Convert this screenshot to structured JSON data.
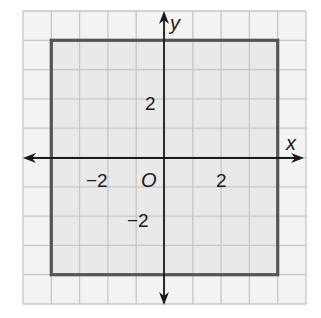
{
  "figure": {
    "type": "coordinate-grid",
    "grid": {
      "x_range": [
        -5,
        5
      ],
      "y_range": [
        -5,
        5
      ],
      "step": 1,
      "background": "#f3f3f3",
      "line_color": "#c6c6c6"
    },
    "axes": {
      "x_label": "x",
      "y_label": "y",
      "origin_label": "O",
      "color": "#1a1a1a"
    },
    "tick_labels": {
      "x": [
        {
          "value": -2,
          "text": "−2"
        },
        {
          "value": 2,
          "text": "2"
        }
      ],
      "y": [
        {
          "value": 2,
          "text": "2"
        },
        {
          "value": -2,
          "text": "−2"
        }
      ]
    },
    "shape": {
      "type": "square",
      "vertices": [
        [
          -4,
          4
        ],
        [
          4,
          4
        ],
        [
          4,
          -4
        ],
        [
          -4,
          -4
        ]
      ],
      "fill": "#e9e9e9",
      "stroke": "#555555"
    }
  }
}
